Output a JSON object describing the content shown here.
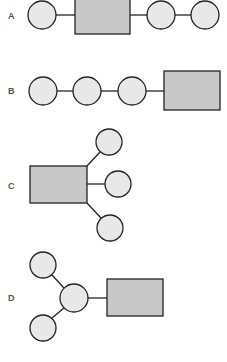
{
  "diagram": {
    "title": "",
    "styles": {
      "circle_fill": "#e8e8e8",
      "rect_fill": "#c8c8c8",
      "stroke": "#222222",
      "label_color": "#555555"
    },
    "panels": [
      {
        "id": "A",
        "label": "A",
        "label_pos": [
          11,
          19
        ],
        "nodes": [
          {
            "id": "a1",
            "shape": "circle",
            "cx": 42,
            "cy": 15,
            "r": 14
          },
          {
            "id": "a2",
            "shape": "rect",
            "x": 75,
            "y": -1,
            "w": 55,
            "h": 35
          },
          {
            "id": "a3",
            "shape": "circle",
            "cx": 161,
            "cy": 15,
            "r": 14
          },
          {
            "id": "a4",
            "shape": "circle",
            "cx": 205,
            "cy": 15,
            "r": 14
          }
        ],
        "edges": [
          [
            "a1",
            "a2"
          ],
          [
            "a2",
            "a3"
          ],
          [
            "a3",
            "a4"
          ]
        ]
      },
      {
        "id": "B",
        "label": "B",
        "label_pos": [
          11,
          94
        ],
        "nodes": [
          {
            "id": "b1",
            "shape": "circle",
            "cx": 43,
            "cy": 91,
            "r": 14
          },
          {
            "id": "b2",
            "shape": "circle",
            "cx": 87,
            "cy": 91,
            "r": 14
          },
          {
            "id": "b3",
            "shape": "circle",
            "cx": 132,
            "cy": 91,
            "r": 14
          },
          {
            "id": "b4",
            "shape": "rect",
            "x": 164,
            "y": 71,
            "w": 56,
            "h": 39
          }
        ],
        "edges": [
          [
            "b1",
            "b2"
          ],
          [
            "b2",
            "b3"
          ],
          [
            "b3",
            "b4"
          ]
        ]
      },
      {
        "id": "C",
        "label": "C",
        "label_pos": [
          11,
          189
        ],
        "nodes": [
          {
            "id": "c1",
            "shape": "rect",
            "x": 30,
            "y": 166,
            "w": 57,
            "h": 37
          },
          {
            "id": "c2",
            "shape": "circle",
            "cx": 109,
            "cy": 142,
            "r": 13
          },
          {
            "id": "c3",
            "shape": "circle",
            "cx": 118,
            "cy": 184,
            "r": 13
          },
          {
            "id": "c4",
            "shape": "circle",
            "cx": 110,
            "cy": 228,
            "r": 13
          }
        ],
        "edges": [
          [
            "c1",
            "c2"
          ],
          [
            "c1",
            "c3"
          ],
          [
            "c1",
            "c4"
          ]
        ]
      },
      {
        "id": "D",
        "label": "D",
        "label_pos": [
          11,
          301
        ],
        "nodes": [
          {
            "id": "d1",
            "shape": "circle",
            "cx": 43,
            "cy": 265,
            "r": 13
          },
          {
            "id": "d2",
            "shape": "circle",
            "cx": 74,
            "cy": 298,
            "r": 14
          },
          {
            "id": "d3",
            "shape": "circle",
            "cx": 43,
            "cy": 328,
            "r": 13
          },
          {
            "id": "d4",
            "shape": "rect",
            "x": 107,
            "y": 279,
            "w": 56,
            "h": 37
          }
        ],
        "edges": [
          [
            "d1",
            "d2"
          ],
          [
            "d3",
            "d2"
          ],
          [
            "d2",
            "d4"
          ]
        ]
      }
    ]
  }
}
